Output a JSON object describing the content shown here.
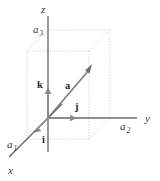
{
  "figure": {
    "name": "3d-cartesian-vector-decomposition",
    "background_color": "#ffffff",
    "width": 160,
    "height": 181
  },
  "axes": {
    "x": {
      "label": "x",
      "color": "#6b6b6b",
      "direction": "down-left-front",
      "tick_label": "a",
      "tick_subscript": "1",
      "tick_label_full": "a1"
    },
    "y": {
      "label": "y",
      "color": "#6b6b6b",
      "direction": "right",
      "tick_label": "a",
      "tick_subscript": "2",
      "tick_label_full": "a2"
    },
    "z": {
      "label": "z",
      "color": "#6b6b6b",
      "direction": "up",
      "tick_label": "a",
      "tick_subscript": "3",
      "tick_label_full": "a3"
    }
  },
  "vectors": {
    "a": {
      "label": "a",
      "description": "position vector from origin to box corner",
      "color": "#7d7d7d",
      "bold": true
    },
    "i": {
      "label": "i",
      "description": "unit vector along x axis",
      "color": "#8a8a8a",
      "bold": true
    },
    "j": {
      "label": "j",
      "description": "unit vector along y axis",
      "color": "#8a8a8a",
      "bold": true
    },
    "k": {
      "label": "k",
      "description": "unit vector along z axis",
      "color": "#8a8a8a",
      "bold": true
    }
  },
  "box": {
    "style": "dotted",
    "color": "#c9c9c9",
    "description": "dotted rectangular parallelepiped showing vector components"
  }
}
